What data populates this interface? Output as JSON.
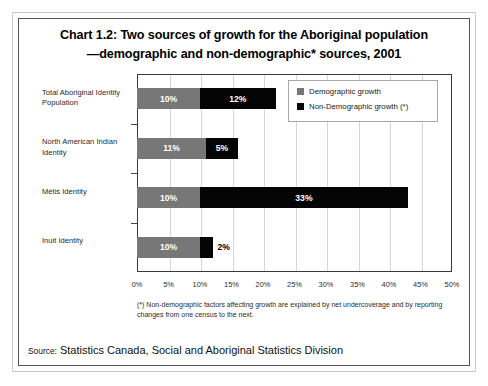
{
  "title": {
    "line1": "Chart 1.2:  Two sources of growth for the Aboriginal population",
    "line2": "—demographic and non-demographic* sources, 2001"
  },
  "legend": {
    "items": [
      {
        "label": "Demographic growth",
        "color": "#777777"
      },
      {
        "label": "Non-Demographic growth (*)",
        "color": "#050505"
      }
    ]
  },
  "footnote": "(*) Non-demographic factors affecting growth are explained by net undercoverage and by reporting changes from one census to the next.",
  "source": {
    "prefix": "Source:",
    "text": "Statistics Canada, Social and Aboriginal Statistics Division"
  },
  "chart_data": {
    "type": "bar",
    "orientation": "horizontal",
    "stacked": true,
    "title": "Chart 1.2:  Two sources of growth for the Aboriginal population —demographic and non-demographic* sources, 2001",
    "xlabel": "",
    "ylabel": "",
    "xlim": [
      0,
      50
    ],
    "xunit": "%",
    "grid": true,
    "legend_position": "top-right",
    "xticklabels": [
      "0%",
      "5%",
      "10%",
      "15%",
      "20%",
      "25%",
      "30%",
      "35%",
      "40%",
      "45%",
      "50%"
    ],
    "xtickvalues": [
      0,
      5,
      10,
      15,
      20,
      25,
      30,
      35,
      40,
      45,
      50
    ],
    "categories": [
      "Total Aboriginal Identity Population",
      "North American Indian Identity",
      "Métis Identity",
      "Inuit Identity"
    ],
    "series": [
      {
        "name": "Demographic growth",
        "color": "#777777",
        "values": [
          10,
          11,
          10,
          10
        ],
        "labels": [
          "10%",
          "11%",
          "10%",
          "10%"
        ]
      },
      {
        "name": "Non-Demographic growth (*)",
        "color": "#050505",
        "values": [
          12,
          5,
          33,
          2
        ],
        "labels": [
          "12%",
          "5%",
          "33%",
          "2%"
        ]
      }
    ],
    "totals": [
      22,
      16,
      43,
      12
    ]
  }
}
